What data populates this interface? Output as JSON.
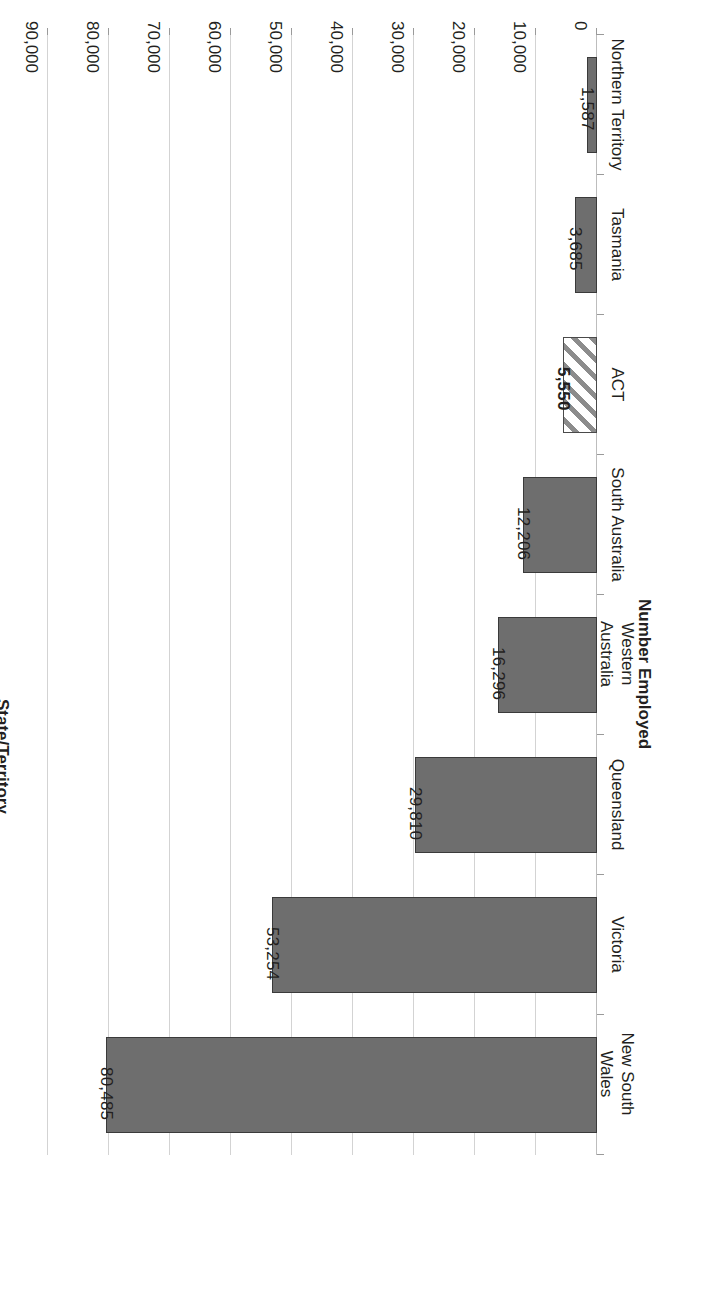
{
  "chart_data": {
    "type": "bar",
    "orientation": "horizontal",
    "title": "",
    "xlabel": "Number Employed",
    "ylabel": "State/Territory",
    "categories": [
      "New South\nWales",
      "Victoria",
      "Queensland",
      "Western\nAustralia",
      "South Australia",
      "ACT",
      "Tasmania",
      "Northern Territory"
    ],
    "values": [
      80485,
      53254,
      29810,
      16296,
      12206,
      5550,
      3685,
      1587
    ],
    "value_labels": [
      "80,485",
      "53,254",
      "29,810",
      "16,296",
      "12,206",
      "5,550",
      "3,685",
      "1,587"
    ],
    "highlighted_category": "ACT",
    "highlight_style": "diagonal-hatch",
    "bar_color": "#6e6e6e",
    "bar_border_color": "#3a3a3a",
    "grid": true,
    "gridline_color": "#d3d3d3",
    "legend": "none",
    "xlim": [
      0,
      90000
    ],
    "tick_step": 10000,
    "tick_labels": [
      "0",
      "10,000",
      "20,000",
      "30,000",
      "40,000",
      "50,000",
      "60,000",
      "70,000",
      "80,000",
      "90,000"
    ],
    "tick_values": [
      0,
      10000,
      20000,
      30000,
      40000,
      50000,
      60000,
      70000,
      80000,
      90000
    ],
    "rotation": "180deg"
  },
  "axes": {
    "value_axis_title": "Number Employed",
    "category_axis_title": "State/Territory"
  }
}
